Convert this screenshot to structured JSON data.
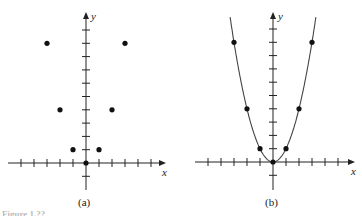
{
  "figure": {
    "caption_partial": "Figure 1.??",
    "panels": [
      {
        "label": "(a)",
        "x_axis_label": "x",
        "y_axis_label": "y"
      },
      {
        "label": "(b)",
        "x_axis_label": "x",
        "y_axis_label": "y"
      }
    ]
  },
  "chart_data": [
    {
      "type": "scatter",
      "title": "(a)",
      "xlabel": "x",
      "ylabel": "y",
      "x": [
        -3,
        -2,
        -1,
        0,
        1,
        2,
        3
      ],
      "y": [
        9,
        4,
        1,
        0,
        1,
        4,
        9
      ],
      "xlim": [
        -6,
        6
      ],
      "ylim": [
        -2,
        11
      ],
      "x_ticks": [
        -5,
        -4,
        -3,
        -2,
        -1,
        1,
        2,
        3,
        4,
        5
      ],
      "y_ticks": [
        -1,
        1,
        2,
        3,
        4,
        5,
        6,
        7,
        8,
        9,
        10
      ],
      "tick_labels": false,
      "grid": false,
      "legend": null
    },
    {
      "type": "scatter",
      "title": "(b)",
      "xlabel": "x",
      "ylabel": "y",
      "series": [
        {
          "name": "points",
          "x": [
            -3,
            -2,
            -1,
            0,
            1,
            2,
            3
          ],
          "y": [
            9,
            4,
            1,
            0,
            1,
            4,
            9
          ]
        },
        {
          "name": "curve y = x^2",
          "type": "line",
          "x": [
            -3.3,
            3.3
          ],
          "function": "x^2"
        }
      ],
      "xlim": [
        -6,
        6
      ],
      "ylim": [
        -2,
        11
      ],
      "x_ticks": [
        -5,
        -4,
        -3,
        -2,
        -1,
        1,
        2,
        3,
        4,
        5
      ],
      "y_ticks": [
        -1,
        1,
        2,
        3,
        4,
        5,
        6,
        7,
        8,
        9,
        10
      ],
      "tick_labels": false,
      "grid": false,
      "legend": null
    }
  ]
}
